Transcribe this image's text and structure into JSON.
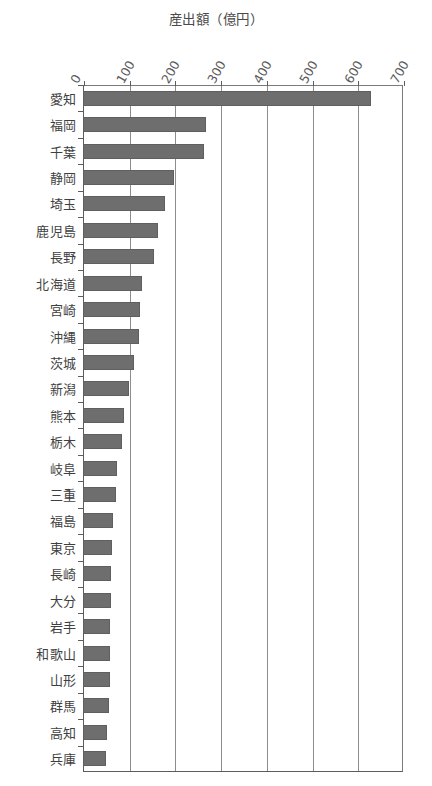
{
  "chart_data": {
    "type": "bar",
    "orientation": "horizontal",
    "title": "産出額（億円）",
    "xlabel": "",
    "ylabel": "",
    "xlim": [
      0,
      700
    ],
    "xticks": [
      0,
      100,
      200,
      300,
      400,
      500,
      600,
      700
    ],
    "xtick_labels": [
      "0",
      "100",
      "200",
      "300",
      "400",
      "500",
      "600",
      "700"
    ],
    "grid": "vertical",
    "legend": "none",
    "bar_color": "#6e6e6e",
    "categories": [
      "愛知",
      "福岡",
      "千葉",
      "静岡",
      "埼玉",
      "鹿児島",
      "長野",
      "北海道",
      "宮崎",
      "沖縄",
      "茨城",
      "新潟",
      "熊本",
      "栃木",
      "岐阜",
      "三重",
      "福島",
      "東京",
      "長崎",
      "大分",
      "岩手",
      "和歌山",
      "山形",
      "群馬",
      "高知",
      "兵庫"
    ],
    "values": [
      630,
      270,
      265,
      200,
      180,
      165,
      155,
      130,
      125,
      122,
      112,
      100,
      90,
      85,
      75,
      73,
      65,
      63,
      62,
      62,
      60,
      60,
      58,
      57,
      53,
      50
    ]
  }
}
